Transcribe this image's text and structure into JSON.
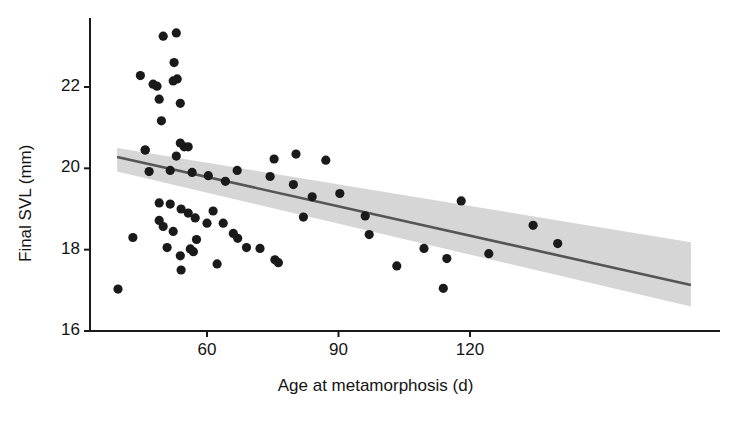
{
  "chart_data": {
    "type": "scatter",
    "title": "",
    "xlabel": "Age at metamorphosis (d)",
    "ylabel": "Final SVL (mm)",
    "xlim": [
      42,
      198
    ],
    "ylim": [
      15.7,
      23.6
    ],
    "xticks": [
      60,
      90,
      120
    ],
    "yticks": [
      16,
      18,
      20,
      22
    ],
    "xtick_labels": [
      "60",
      "90",
      "120"
    ],
    "ytick_labels": [
      "16",
      "18",
      "20",
      "22"
    ],
    "grid": false,
    "legend": null,
    "point_color": "#1a1a1a",
    "line_color": "#555555",
    "band_color": "#d4d4d4",
    "axis_color": "#1a1a1a",
    "marker_size_px": 4.6,
    "points": [
      {
        "x": 50.0,
        "y": 23.25
      },
      {
        "x": 53.0,
        "y": 23.33
      },
      {
        "x": 52.5,
        "y": 22.6
      },
      {
        "x": 44.8,
        "y": 22.28
      },
      {
        "x": 47.7,
        "y": 22.07
      },
      {
        "x": 48.6,
        "y": 22.02
      },
      {
        "x": 52.3,
        "y": 22.15
      },
      {
        "x": 53.2,
        "y": 22.2
      },
      {
        "x": 49.1,
        "y": 21.7
      },
      {
        "x": 53.9,
        "y": 21.6
      },
      {
        "x": 49.6,
        "y": 21.17
      },
      {
        "x": 53.9,
        "y": 20.62
      },
      {
        "x": 45.9,
        "y": 20.45
      },
      {
        "x": 54.8,
        "y": 20.53
      },
      {
        "x": 55.7,
        "y": 20.53
      },
      {
        "x": 53.0,
        "y": 20.3
      },
      {
        "x": 45.9,
        "y": 20.45
      },
      {
        "x": 46.8,
        "y": 19.92
      },
      {
        "x": 51.6,
        "y": 19.95
      },
      {
        "x": 56.6,
        "y": 19.9
      },
      {
        "x": 60.3,
        "y": 19.82
      },
      {
        "x": 64.2,
        "y": 19.68
      },
      {
        "x": 66.9,
        "y": 19.95
      },
      {
        "x": 75.3,
        "y": 20.23
      },
      {
        "x": 80.3,
        "y": 20.35
      },
      {
        "x": 87.1,
        "y": 20.2
      },
      {
        "x": 74.4,
        "y": 19.8
      },
      {
        "x": 79.7,
        "y": 19.6
      },
      {
        "x": 49.1,
        "y": 19.15
      },
      {
        "x": 51.6,
        "y": 19.12
      },
      {
        "x": 54.1,
        "y": 19.0
      },
      {
        "x": 55.7,
        "y": 18.9
      },
      {
        "x": 57.3,
        "y": 18.78
      },
      {
        "x": 49.1,
        "y": 18.72
      },
      {
        "x": 50.0,
        "y": 18.57
      },
      {
        "x": 52.3,
        "y": 18.45
      },
      {
        "x": 61.4,
        "y": 18.95
      },
      {
        "x": 60.0,
        "y": 18.65
      },
      {
        "x": 63.7,
        "y": 18.65
      },
      {
        "x": 57.6,
        "y": 18.25
      },
      {
        "x": 50.9,
        "y": 18.05
      },
      {
        "x": 56.2,
        "y": 18.02
      },
      {
        "x": 56.9,
        "y": 17.95
      },
      {
        "x": 43.1,
        "y": 18.3
      },
      {
        "x": 53.9,
        "y": 17.85
      },
      {
        "x": 62.3,
        "y": 17.65
      },
      {
        "x": 54.1,
        "y": 17.5
      },
      {
        "x": 66.0,
        "y": 18.4
      },
      {
        "x": 67.0,
        "y": 18.28
      },
      {
        "x": 39.7,
        "y": 17.03
      },
      {
        "x": 69.0,
        "y": 18.05
      },
      {
        "x": 72.1,
        "y": 18.03
      },
      {
        "x": 75.5,
        "y": 17.75
      },
      {
        "x": 76.3,
        "y": 17.68
      },
      {
        "x": 96.1,
        "y": 18.83
      },
      {
        "x": 97.0,
        "y": 18.37
      },
      {
        "x": 109.5,
        "y": 18.03
      },
      {
        "x": 114.7,
        "y": 17.78
      },
      {
        "x": 103.3,
        "y": 17.6
      },
      {
        "x": 118.0,
        "y": 19.2
      },
      {
        "x": 134.4,
        "y": 18.6
      },
      {
        "x": 140.0,
        "y": 18.15
      },
      {
        "x": 124.3,
        "y": 17.9
      },
      {
        "x": 113.9,
        "y": 17.05
      },
      {
        "x": 90.3,
        "y": 19.38
      },
      {
        "x": 84.0,
        "y": 19.3
      },
      {
        "x": 82.0,
        "y": 18.8
      }
    ],
    "trend": {
      "x_start": 39.5,
      "y_start": 20.28,
      "x_end": 170.4,
      "y_end": 17.13,
      "band_upper_start": 20.5,
      "band_lower_start": 19.92,
      "band_upper_end": 18.18,
      "band_lower_end": 16.6
    }
  },
  "figure": {
    "x_axis_title": "Age at metamorphosis (d)",
    "y_axis_title": "Final SVL (mm)"
  }
}
